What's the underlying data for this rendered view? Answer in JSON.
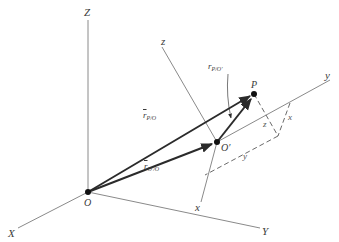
{
  "diagram": {
    "type": "relative-position-vectors-3d",
    "colors": {
      "axis": "#8a8a8a",
      "vector": "#2b2b2b",
      "dashed": "#6a6a6a",
      "point": "#111111",
      "label": "#3a3a3a"
    },
    "global_axes": {
      "X": {
        "label": "X"
      },
      "Y": {
        "label": "Y"
      },
      "Z": {
        "label": "Z"
      }
    },
    "local_axes": {
      "x": {
        "label": "x"
      },
      "y": {
        "label": "y"
      },
      "z": {
        "label": "z"
      }
    },
    "points": {
      "O": {
        "label": "O"
      },
      "O_prime": {
        "label": "O′"
      },
      "P": {
        "label": "P"
      }
    },
    "vectors": {
      "r_P_O": {
        "symbol": "r",
        "subscript": "P/O"
      },
      "r_Oprime_O": {
        "symbol": "r",
        "subscript": "O′/O"
      },
      "r_P_Oprime": {
        "symbol": "r",
        "subscript": "P/O′"
      }
    },
    "components": {
      "x": "x",
      "y": "y",
      "z": "z"
    }
  }
}
